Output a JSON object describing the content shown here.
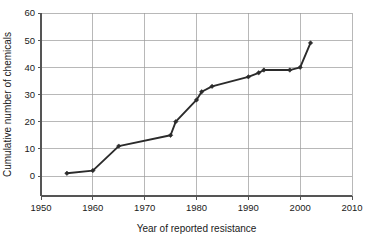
{
  "chart_data": {
    "type": "line",
    "title": "",
    "subtitle": "",
    "xlabel": "Year of reported resistance",
    "ylabel": "Cumulative number of chemicals",
    "xlim": [
      1950,
      2010
    ],
    "ylim": [
      0,
      60
    ],
    "xticks": [
      1950,
      1960,
      1970,
      1980,
      1990,
      2000,
      2010
    ],
    "xtick_labels": [
      "1950",
      "1960",
      "1970",
      "1980",
      "1990",
      "2000",
      "2010"
    ],
    "yticks": [
      0,
      10,
      20,
      30,
      40,
      50,
      60
    ],
    "ytick_labels": [
      "0",
      "10",
      "20",
      "30",
      "40",
      "50",
      "60"
    ],
    "grid": "horizontal-and-vertical",
    "legend": "none",
    "marker": "diamond",
    "line_color": "#2b2b2b",
    "grid_color": "#9a9a9a",
    "axis_color": "#555555",
    "background": "#ffffff",
    "series": [
      {
        "name": "Cumulative number of chemicals with reported resistance",
        "x": [
          1955,
          1960,
          1965,
          1975,
          1976,
          1980,
          1981,
          1983,
          1990,
          1992,
          1993,
          1998,
          2000,
          2002
        ],
        "values": [
          1,
          2,
          11,
          15,
          20,
          28,
          31,
          33,
          36.5,
          38,
          39,
          39,
          40,
          49
        ]
      }
    ],
    "points": [
      {
        "x": 1955,
        "y": 1
      },
      {
        "x": 1960,
        "y": 2
      },
      {
        "x": 1965,
        "y": 11
      },
      {
        "x": 1975,
        "y": 15
      },
      {
        "x": 1976,
        "y": 20
      },
      {
        "x": 1980,
        "y": 28
      },
      {
        "x": 1981,
        "y": 31
      },
      {
        "x": 1983,
        "y": 33
      },
      {
        "x": 1990,
        "y": 36.5
      },
      {
        "x": 1992,
        "y": 38
      },
      {
        "x": 1993,
        "y": 39
      },
      {
        "x": 1998,
        "y": 39
      },
      {
        "x": 2000,
        "y": 40
      },
      {
        "x": 2002,
        "y": 49
      }
    ]
  }
}
